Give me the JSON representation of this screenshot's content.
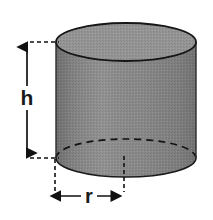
{
  "figure": {
    "shape": "cylinder",
    "background_color": "#ffffff",
    "body_fill": "#8a8a8a",
    "top_face_fill": "#959595",
    "outline_color": "#1a1a1a",
    "dashed_color": "#1a1a1a",
    "geometry": {
      "left_x": 56,
      "right_x": 196,
      "top_center_y": 42,
      "bottom_center_y": 158,
      "radius_x": 70,
      "radius_y": 19,
      "center_x": 126,
      "height_px": 116
    }
  },
  "dimensions": {
    "height": {
      "label": "h",
      "label_x": 27,
      "label_y": 103,
      "arrow_x": 27,
      "arrow_top_y": 42,
      "arrow_bottom_y": 158
    },
    "radius": {
      "label": "r",
      "label_x": 89,
      "label_y": 202,
      "arrow_y": 196,
      "arrow_left_x": 55,
      "arrow_right_x": 124
    }
  },
  "leaders": {
    "top_horizontal": {
      "x1": 30,
      "y1": 42,
      "x2": 58,
      "y2": 42
    },
    "bottom_horizontal": {
      "x1": 30,
      "y1": 158,
      "x2": 58,
      "y2": 158
    },
    "left_vertical": {
      "x1": 55,
      "y1": 160,
      "x2": 55,
      "y2": 193
    },
    "center_vertical": {
      "x1": 124,
      "y1": 158,
      "x2": 124,
      "y2": 193
    }
  }
}
